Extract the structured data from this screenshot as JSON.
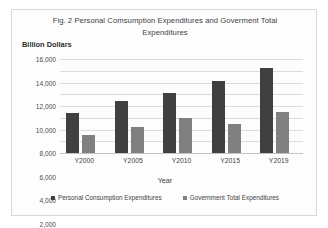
{
  "chart_data": {
    "type": "bar",
    "title": "Fig. 2 Personal Comsumption Expenditures and Goverment Total Expenditures",
    "xlabel": "Year",
    "ylabel": "Billion Dollars",
    "categories": [
      "Y2000",
      "Y2005",
      "Y2010",
      "Y2015",
      "Y2019"
    ],
    "series": [
      {
        "name": "Personal Consumption Expenditures",
        "color": "#404040",
        "values": [
          6800,
          8800,
          10300,
          12300,
          14400
        ]
      },
      {
        "name": "Government Total Expenditures",
        "color": "#808080",
        "values": [
          3100,
          4500,
          5900,
          4900,
          7000
        ]
      }
    ],
    "ylim": [
      0,
      16000
    ],
    "ytick_step": 2000,
    "ytick_labels": [
      "16,000",
      "14,000",
      "12,000",
      "10,000",
      "8,000",
      "6,000",
      "4,000",
      "2,000",
      "-"
    ],
    "ytick_values": [
      16000,
      14000,
      12000,
      10000,
      8000,
      6000,
      4000,
      2000,
      0
    ],
    "grid": true,
    "legend_position": "bottom"
  }
}
